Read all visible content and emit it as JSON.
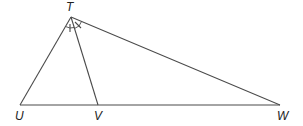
{
  "diagram": {
    "type": "triangle-with-angle-bisector",
    "points": {
      "T": {
        "label": "T",
        "x": 71,
        "y": 17
      },
      "U": {
        "label": "U",
        "x": 20,
        "y": 105
      },
      "V": {
        "label": "V",
        "x": 98,
        "y": 105
      },
      "W": {
        "label": "W",
        "x": 280,
        "y": 105
      }
    },
    "segments": [
      "TU",
      "TV",
      "TW",
      "UW"
    ],
    "angle_marks": [
      {
        "vertex": "T",
        "between": [
          "TU",
          "TV"
        ],
        "ticks": 1
      },
      {
        "vertex": "T",
        "between": [
          "TV",
          "TW"
        ],
        "ticks": 1
      }
    ],
    "colors": {
      "stroke": "#4a4a4a",
      "label": "#222222",
      "background": "#ffffff"
    }
  },
  "labels": {
    "T": "T",
    "U": "U",
    "V": "V",
    "W": "W"
  }
}
